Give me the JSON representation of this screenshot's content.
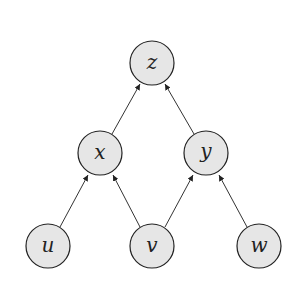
{
  "diagram": {
    "type": "directed-acyclic-graph",
    "colors": {
      "node_fill": "#e6e6e6",
      "node_stroke": "#222222",
      "edge": "#333333"
    },
    "nodes": [
      {
        "id": "z",
        "label": "z",
        "cx": 152,
        "cy": 63
      },
      {
        "id": "x",
        "label": "x",
        "cx": 100,
        "cy": 153
      },
      {
        "id": "y",
        "label": "y",
        "cx": 206,
        "cy": 153
      },
      {
        "id": "u",
        "label": "u",
        "cx": 48,
        "cy": 246
      },
      {
        "id": "v",
        "label": "v",
        "cx": 152,
        "cy": 246
      },
      {
        "id": "w",
        "label": "w",
        "cx": 259,
        "cy": 246
      }
    ],
    "edges": [
      {
        "from": "x",
        "to": "z"
      },
      {
        "from": "y",
        "to": "z"
      },
      {
        "from": "u",
        "to": "x"
      },
      {
        "from": "v",
        "to": "x"
      },
      {
        "from": "v",
        "to": "y"
      },
      {
        "from": "w",
        "to": "y"
      }
    ]
  }
}
